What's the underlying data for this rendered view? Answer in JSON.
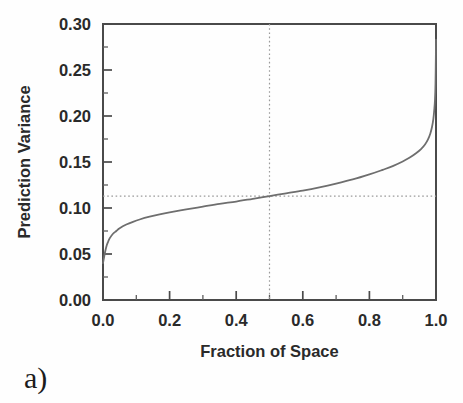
{
  "figure": {
    "panel_label": "a)",
    "background_color": "#fefefe",
    "frame_color": "#4a4a4a",
    "curve_color": "#6e6e6e",
    "guide_color": "#9a9a9a"
  },
  "chart_data": {
    "type": "line",
    "title": "",
    "xlabel": "Fraction of Space",
    "ylabel": "Prediction Variance",
    "xlim": [
      0.0,
      1.0
    ],
    "ylim": [
      0.0,
      0.3
    ],
    "grid": false,
    "legend": null,
    "x_ticks": [
      0.0,
      0.2,
      0.4,
      0.6,
      0.8,
      1.0
    ],
    "x_tick_labels": [
      "0.0",
      "0.2",
      "0.4",
      "0.6",
      "0.8",
      "1.0"
    ],
    "x_minor_tick_step": 0.1,
    "y_ticks": [
      0.0,
      0.05,
      0.1,
      0.15,
      0.2,
      0.25,
      0.3
    ],
    "y_tick_labels": [
      "0.00",
      "0.05",
      "0.10",
      "0.15",
      "0.20",
      "0.25",
      "0.30"
    ],
    "y_minor_tick_step": 0.025,
    "series": [
      {
        "name": "Prediction Variance",
        "x": [
          0.0,
          0.005,
          0.01,
          0.015,
          0.02,
          0.03,
          0.04,
          0.05,
          0.07,
          0.09,
          0.11,
          0.14,
          0.17,
          0.2,
          0.25,
          0.3,
          0.35,
          0.4,
          0.45,
          0.5,
          0.55,
          0.6,
          0.65,
          0.7,
          0.75,
          0.8,
          0.84,
          0.87,
          0.9,
          0.92,
          0.94,
          0.955,
          0.967,
          0.976,
          0.983,
          0.988,
          0.992,
          0.995,
          0.997,
          0.9985,
          0.9995,
          1.0
        ],
        "y": [
          0.04,
          0.05,
          0.058,
          0.063,
          0.067,
          0.072,
          0.075,
          0.078,
          0.082,
          0.085,
          0.0875,
          0.0905,
          0.093,
          0.0952,
          0.0985,
          0.1015,
          0.1045,
          0.107,
          0.11,
          0.113,
          0.116,
          0.119,
          0.1225,
          0.1265,
          0.131,
          0.1365,
          0.1415,
          0.1455,
          0.1505,
          0.1545,
          0.1595,
          0.164,
          0.169,
          0.1745,
          0.181,
          0.188,
          0.1965,
          0.2075,
          0.218,
          0.235,
          0.262,
          0.283
        ]
      }
    ],
    "annotations": [
      {
        "name": "median-vertical-guide",
        "kind": "vertical-dotted-line",
        "x": 0.5,
        "label": ""
      },
      {
        "name": "median-horizontal-guide",
        "kind": "horizontal-dotted-line",
        "y": 0.113,
        "label": ""
      }
    ]
  }
}
